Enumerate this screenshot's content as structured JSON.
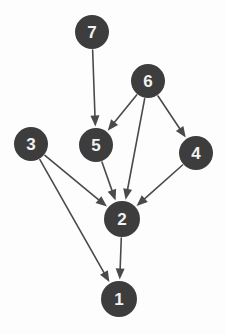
{
  "diagram": {
    "type": "directed-graph",
    "background_color": "#fdfdfd",
    "node_fill": "#3d3d3d",
    "node_label_color": "#f2f2f2",
    "edge_color": "#4a4a4a",
    "node_radius": 17,
    "node_font_size": 17,
    "edge_width": 1.6,
    "arrow_length": 11,
    "arrow_width": 9,
    "nodes": [
      {
        "id": "7",
        "label": "7",
        "cx": 92,
        "cy": 32,
        "r": 17
      },
      {
        "id": "6",
        "label": "6",
        "cx": 148,
        "cy": 81,
        "r": 17
      },
      {
        "id": "3",
        "label": "3",
        "cx": 31,
        "cy": 144,
        "r": 17
      },
      {
        "id": "5",
        "label": "5",
        "cx": 96,
        "cy": 145,
        "r": 17
      },
      {
        "id": "4",
        "label": "4",
        "cx": 196,
        "cy": 153,
        "r": 17
      },
      {
        "id": "2",
        "label": "2",
        "cx": 122,
        "cy": 219,
        "r": 18
      },
      {
        "id": "1",
        "label": "1",
        "cx": 119,
        "cy": 299,
        "r": 18
      }
    ],
    "edges": [
      {
        "from": "7",
        "to": "5",
        "label": ""
      },
      {
        "from": "6",
        "to": "5",
        "label": ""
      },
      {
        "from": "6",
        "to": "2",
        "label": ""
      },
      {
        "from": "6",
        "to": "4",
        "label": ""
      },
      {
        "from": "3",
        "to": "2",
        "label": ""
      },
      {
        "from": "3",
        "to": "1",
        "label": ""
      },
      {
        "from": "5",
        "to": "2",
        "label": ""
      },
      {
        "from": "4",
        "to": "2",
        "label": ""
      },
      {
        "from": "2",
        "to": "1",
        "label": ""
      }
    ]
  }
}
